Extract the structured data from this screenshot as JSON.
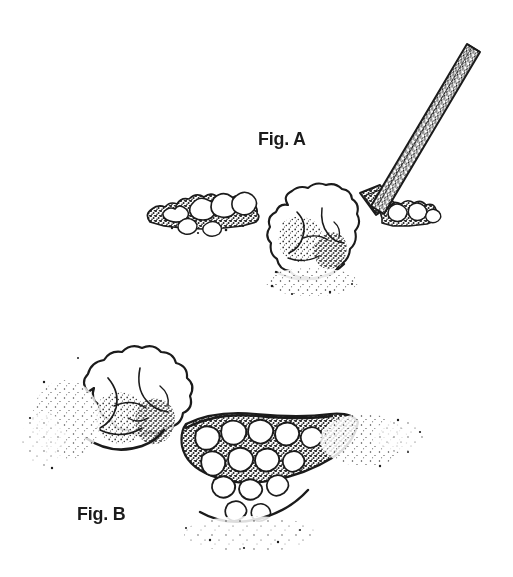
{
  "page": {
    "background_color": "#ffffff",
    "ink_color": "#1b1b1b",
    "width": 513,
    "height": 577
  },
  "title": "A big rock can't be budged",
  "figures": [
    {
      "id": "fig-a",
      "label": "Fig. A"
    },
    {
      "id": "fig-b",
      "label": "Fig. B"
    }
  ],
  "illustration": {
    "style": "pen-and-ink stipple line drawing",
    "scene_a": {
      "caption": "Fig. A",
      "description": "A pry bar / digging tool angled from upper right down into the ground beside a large boulder, with smaller rocks scattered along the ground line.",
      "elements": [
        "tool-handle",
        "tool-blade",
        "large-boulder",
        "small-rock-cluster-left",
        "small-rock-cluster-right",
        "ground-line"
      ]
    },
    "scene_b": {
      "caption": "Fig. B",
      "description": "The large boulder resting on the ground at the left, with a hole beside it filled with a cluster of smaller rocks.",
      "elements": [
        "large-boulder",
        "rock-filled-hole",
        "ground-shadow"
      ]
    }
  }
}
